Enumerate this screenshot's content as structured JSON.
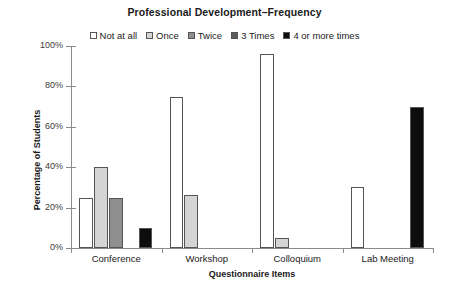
{
  "chart_data": {
    "type": "bar",
    "title": "Professional Development–Frequency",
    "xlabel": "Questionnaire Items",
    "ylabel": "Percentage of Students",
    "categories": [
      "Conference",
      "Workshop",
      "Colloquium",
      "Lab Meeting"
    ],
    "series": [
      {
        "name": "Not at all",
        "color": "#ffffff",
        "values": [
          25,
          75,
          96,
          30
        ]
      },
      {
        "name": "Once",
        "color": "#d4d4d4",
        "values": [
          40,
          26,
          5,
          0
        ]
      },
      {
        "name": "Twice",
        "color": "#8f8f8f",
        "values": [
          25,
          0,
          0,
          0
        ]
      },
      {
        "name": "3 Times",
        "color": "#5a5a5a",
        "values": [
          0,
          0,
          0,
          0
        ]
      },
      {
        "name": "4 or more times",
        "color": "#0d0d0d",
        "values": [
          10,
          0,
          0,
          70
        ]
      }
    ],
    "ylim": [
      0,
      100
    ],
    "yticks": [
      "0%",
      "20%",
      "40%",
      "60%",
      "80%",
      "100%"
    ],
    "ytick_values": [
      0,
      20,
      40,
      60,
      80,
      100
    ],
    "grid": false,
    "legend_position": "top-center",
    "bar_edge_color": "#555555"
  }
}
